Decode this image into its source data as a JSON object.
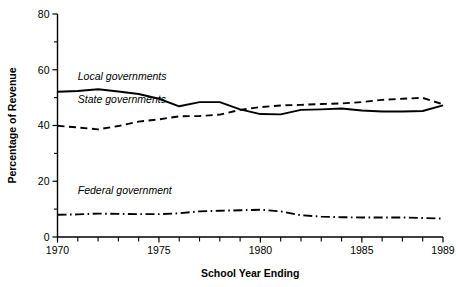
{
  "chart_data": {
    "type": "line",
    "title": "",
    "xlabel": "School Year Ending",
    "ylabel": "Percentage of Revenue",
    "xlim": [
      1970,
      1989
    ],
    "ylim": [
      0,
      80
    ],
    "grid": false,
    "legend_position": "inline-labels",
    "x": [
      1970,
      1971,
      1972,
      1973,
      1974,
      1975,
      1976,
      1977,
      1978,
      1979,
      1980,
      1981,
      1982,
      1983,
      1984,
      1985,
      1986,
      1987,
      1988,
      1989
    ],
    "y_ticks_major": [
      0,
      20,
      40,
      60,
      80
    ],
    "y_ticks_minor": [
      10,
      30,
      50,
      70
    ],
    "y_tick_labels": [
      "0",
      "20",
      "40",
      "60",
      "80"
    ],
    "x_ticks": [
      1970,
      1971,
      1972,
      1973,
      1974,
      1975,
      1976,
      1977,
      1978,
      1979,
      1980,
      1981,
      1982,
      1983,
      1984,
      1985,
      1986,
      1987,
      1988,
      1989
    ],
    "x_tick_labels_shown": [
      "1970",
      "1975",
      "1980",
      "1985",
      "1989"
    ],
    "x_tick_label_years": [
      1970,
      1975,
      1980,
      1985,
      1989
    ],
    "series": [
      {
        "name": "Local governments",
        "style": "solid",
        "label_x": 1971.0,
        "label_y": 56.5,
        "values": [
          52.1,
          52.4,
          53.0,
          52.2,
          51.3,
          49.6,
          46.9,
          48.4,
          48.4,
          45.8,
          44.1,
          44.0,
          45.6,
          45.8,
          46.1,
          45.4,
          45.0,
          45.0,
          45.2,
          47.2
        ]
      },
      {
        "name": "State governments",
        "style": "dashed",
        "label_x": 1971.0,
        "label_y": 48.0,
        "values": [
          39.9,
          39.3,
          38.6,
          39.8,
          41.4,
          42.2,
          43.3,
          43.4,
          43.9,
          45.6,
          46.6,
          47.2,
          47.4,
          47.7,
          47.9,
          48.4,
          49.2,
          49.6,
          49.9,
          47.6
        ]
      },
      {
        "name": "Federal government",
        "style": "dashdot",
        "label_x": 1971.0,
        "label_y": 15.5,
        "values": [
          8.0,
          8.1,
          8.4,
          8.3,
          8.2,
          8.2,
          8.5,
          9.2,
          9.4,
          9.6,
          9.8,
          9.2,
          7.8,
          7.3,
          7.1,
          7.0,
          7.0,
          7.0,
          6.8,
          6.6
        ]
      }
    ]
  }
}
